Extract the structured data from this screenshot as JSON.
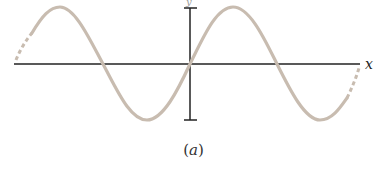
{
  "figure": {
    "caption_open": "(",
    "caption_var": "a",
    "caption_close": ")",
    "x_axis_label": "x",
    "y_axis_label": "y",
    "wave_color": "#c8bcb0",
    "axis_color": "#222222"
  }
}
